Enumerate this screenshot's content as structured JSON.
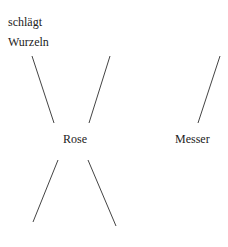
{
  "diagram": {
    "labels": {
      "top_left_line1": "schlägt",
      "top_left_line2": "Wurzeln",
      "center": "Rose",
      "right": "Messer"
    },
    "line_color": "#444444",
    "text_color": "#222222"
  }
}
